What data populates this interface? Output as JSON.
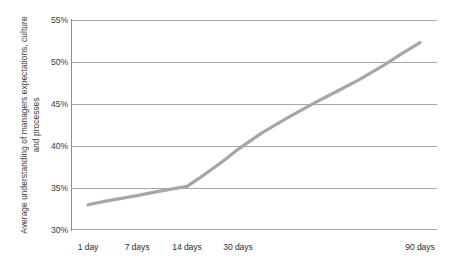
{
  "chart_data": {
    "type": "line",
    "title": "",
    "subtitle": "",
    "xlabel": "",
    "ylabel": "Average understanding of managers expectations, culture and processes",
    "x_tick_labels": [
      "1 day",
      "7 days",
      "14 days",
      "30 days",
      "90 days"
    ],
    "x_tick_positions_days": [
      1,
      7,
      14,
      30,
      90
    ],
    "y_tick_labels": [
      "30%",
      "35%",
      "40%",
      "45%",
      "50%",
      "55%"
    ],
    "y_tick_values": [
      30,
      35,
      40,
      45,
      50,
      55
    ],
    "ylim": [
      30,
      55
    ],
    "xlim_days": [
      1,
      90
    ],
    "grid": "horizontal",
    "legend": "none",
    "series": [
      {
        "name": "Average understanding",
        "color": "#a6a6a6",
        "x": [
          1,
          3,
          7,
          10,
          14,
          18,
          22,
          26,
          30,
          38,
          46,
          54,
          62,
          70,
          78,
          84,
          90
        ],
        "values": [
          33.0,
          33.4,
          34.1,
          34.6,
          35.2,
          36.2,
          37.3,
          38.4,
          39.6,
          41.6,
          43.3,
          44.9,
          46.4,
          47.9,
          49.6,
          51.0,
          52.3
        ]
      }
    ],
    "annotations": []
  },
  "axis": {
    "y_title": "Average understanding of managers expectations, culture and processes",
    "y_ticks": [
      "55%",
      "50%",
      "45%",
      "40%",
      "35%",
      "30%"
    ],
    "x_ticks": [
      "1 day",
      "7 days",
      "14 days",
      "30 days",
      "90 days"
    ]
  },
  "colors": {
    "line": "#a6a6a6",
    "grid": "#a8a8a8",
    "axis": "#8d8d8d",
    "text": "#3a3a3a",
    "background": "#ffffff"
  }
}
